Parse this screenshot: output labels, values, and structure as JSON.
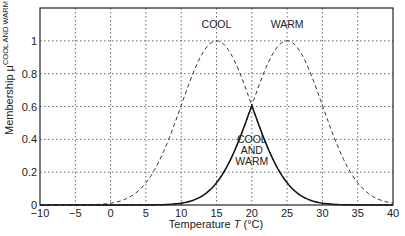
{
  "chart_data": {
    "type": "line",
    "title": "",
    "xlabel": "Temperature T (°C)",
    "xlabel_parts": {
      "pre": "Temperature ",
      "var": "T",
      "post": " (°C)"
    },
    "ylabel": "Membership μ COOL AND WARM",
    "ylabel_parts": {
      "pre": "Membership μ",
      "sup": "COOL AND WARM"
    },
    "xlim": [
      -10,
      40
    ],
    "ylim": [
      0,
      1.2
    ],
    "grid": true,
    "x_ticks": [
      -10,
      -5,
      0,
      5,
      10,
      15,
      20,
      25,
      30,
      35,
      40
    ],
    "y_ticks": [
      0,
      0.2,
      0.4,
      0.6,
      0.8,
      1
    ],
    "y_tick_labels": [
      "0",
      "0.2",
      "0.4",
      "0.6",
      "0.8",
      "1"
    ],
    "series": [
      {
        "name": "COOL",
        "style": "dashed",
        "shape": "gaussian",
        "center": 15,
        "sigma": 5,
        "x": [
          -10,
          -5,
          0,
          5,
          10,
          15,
          20,
          25,
          30,
          35,
          40
        ],
        "values": [
          0.0,
          0.0,
          0.01,
          0.14,
          0.61,
          1.0,
          0.61,
          0.14,
          0.01,
          0.0,
          0.0
        ]
      },
      {
        "name": "WARM",
        "style": "dashed",
        "shape": "gaussian",
        "center": 25,
        "sigma": 5,
        "x": [
          -10,
          -5,
          0,
          5,
          10,
          15,
          20,
          25,
          30,
          35,
          40
        ],
        "values": [
          0.0,
          0.0,
          0.0,
          0.0,
          0.01,
          0.14,
          0.61,
          1.0,
          0.61,
          0.14,
          0.01
        ]
      },
      {
        "name": "COOL AND WARM",
        "style": "solid",
        "shape": "min(COOL, WARM)",
        "x": [
          -10,
          -5,
          0,
          5,
          10,
          15,
          20,
          25,
          30,
          35,
          40
        ],
        "values": [
          0.0,
          0.0,
          0.0,
          0.0,
          0.01,
          0.14,
          0.61,
          0.14,
          0.01,
          0.0,
          0.0
        ]
      }
    ],
    "annotations": [
      {
        "text": "COOL",
        "x": 15,
        "y": 1.08
      },
      {
        "text": "WARM",
        "x": 25,
        "y": 1.08
      },
      {
        "text": "COOL\nAND\nWARM",
        "lines": [
          "COOL",
          "AND",
          "WARM"
        ],
        "x": 20,
        "y": 0.38
      }
    ],
    "legend": "none"
  }
}
